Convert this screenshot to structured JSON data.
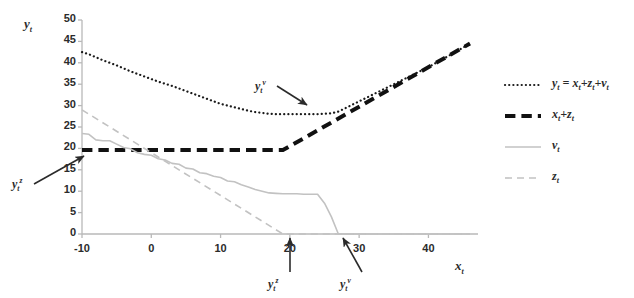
{
  "chart_data": {
    "type": "line",
    "title": "",
    "xlabel": "x_t",
    "ylabel": "y_t",
    "xlim": [
      -10,
      46
    ],
    "ylim": [
      0,
      50
    ],
    "xticks": [
      "-10",
      "0",
      "10",
      "20",
      "30",
      "40"
    ],
    "xtick_values": [
      -10,
      0,
      10,
      20,
      30,
      40
    ],
    "yticks": [
      "0",
      "5",
      "10",
      "15",
      "20",
      "25",
      "30",
      "35",
      "40",
      "45",
      "50"
    ],
    "ytick_values": [
      0,
      5,
      10,
      15,
      20,
      25,
      30,
      35,
      40,
      45,
      50
    ],
    "grid": false,
    "legend_position": "right",
    "series": [
      {
        "name": "y_t = x_t+z_t+v_t",
        "style": "dotted",
        "color": "#1a1a1a",
        "width": 2.2,
        "x": [
          -10,
          -9,
          -8,
          -7,
          -6,
          -5,
          -4,
          -3,
          -2,
          -1,
          0,
          1,
          2,
          3,
          4,
          5,
          6,
          7,
          8,
          9,
          10,
          11,
          12,
          13,
          14,
          15,
          16,
          17,
          18,
          19,
          20,
          22,
          24,
          26,
          27,
          28,
          30,
          32,
          34,
          36,
          38,
          40,
          42,
          44,
          46
        ],
        "values": [
          42.5,
          42.0,
          41.3,
          40.6,
          40.0,
          39.4,
          38.7,
          38.0,
          37.4,
          36.8,
          36.2,
          35.6,
          35.1,
          34.6,
          34.0,
          33.4,
          32.8,
          32.2,
          31.6,
          31.0,
          30.4,
          30.0,
          29.6,
          29.2,
          28.8,
          28.5,
          28.3,
          28.1,
          28.0,
          28.0,
          28.0,
          28.0,
          28.0,
          28.2,
          28.6,
          29.4,
          31.0,
          32.6,
          34.2,
          35.8,
          37.4,
          39.0,
          40.8,
          42.6,
          44.5
        ]
      },
      {
        "name": "x_t+z_t",
        "style": "dashed-bold",
        "color": "#111111",
        "width": 4.0,
        "x": [
          -10,
          0,
          10,
          19,
          46
        ],
        "values": [
          19.6,
          19.6,
          19.6,
          19.6,
          44.5
        ]
      },
      {
        "name": "v_t",
        "style": "solid",
        "color": "#c2c2c2",
        "width": 1.6,
        "x": [
          -10,
          -9,
          -8,
          -7,
          -6,
          -5,
          -4,
          -3,
          -2,
          -1,
          0,
          1,
          2,
          3,
          4,
          5,
          6,
          7,
          8,
          9,
          10,
          11,
          12,
          13,
          14,
          15,
          16,
          17,
          18,
          19,
          20,
          21,
          22,
          23,
          24,
          25,
          26,
          27,
          30,
          35,
          40,
          46
        ],
        "values": [
          23.5,
          23.3,
          22.0,
          21.8,
          21.8,
          21.0,
          20.2,
          19.9,
          19.0,
          18.6,
          18.4,
          17.6,
          17.3,
          16.5,
          16.3,
          15.4,
          15.2,
          14.3,
          14.1,
          13.5,
          13.2,
          12.4,
          12.2,
          11.5,
          11.0,
          10.4,
          10.0,
          9.6,
          9.5,
          9.4,
          9.4,
          9.4,
          9.3,
          9.3,
          9.3,
          7.2,
          4.0,
          0.0,
          0.0,
          0.0,
          0.0,
          0.0
        ]
      },
      {
        "name": "z_t",
        "style": "dashed",
        "color": "#c2c2c2",
        "width": 1.6,
        "x": [
          -10,
          19,
          46
        ],
        "values": [
          29.0,
          0.0,
          0.0
        ]
      }
    ],
    "annotations": [
      {
        "id": "yz-left",
        "label": "y_t^z",
        "text_x": 12,
        "text_y": 176,
        "tip_x": 84,
        "tip_y": 156
      },
      {
        "id": "yv-middle",
        "label": "y_t^v",
        "text_x": 255,
        "text_y": 78,
        "tip_x": 307,
        "tip_y": 105
      },
      {
        "id": "yz-bottom",
        "label": "y_t^z",
        "text_x": 268,
        "text_y": 276,
        "tip_x": 290,
        "tip_y": 238
      },
      {
        "id": "yv-bottom",
        "label": "y_t^v",
        "text_x": 340,
        "text_y": 276,
        "tip_x": 343,
        "tip_y": 238
      }
    ]
  },
  "legend": {
    "items": [
      {
        "label": "y_t = x_t+z_t+v_t",
        "style": "dotted",
        "color": "#1a1a1a"
      },
      {
        "label": "x_t+z_t",
        "style": "dashed-bold",
        "color": "#111111"
      },
      {
        "label": "v_t",
        "style": "solid",
        "color": "#c2c2c2"
      },
      {
        "label": "z_t",
        "style": "dashed",
        "color": "#c2c2c2"
      }
    ]
  },
  "axis_titles": {
    "y": "y_t",
    "x": "x_t"
  },
  "colors": {
    "axis": "#b9b9b9",
    "text": "#2b2b2b",
    "dark_series": "#1a1a1a",
    "light_series": "#c2c2c2",
    "background": "#ffffff"
  }
}
